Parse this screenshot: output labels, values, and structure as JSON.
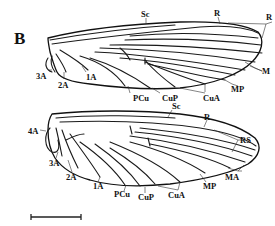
{
  "figure": {
    "panel_letter": "B",
    "colors": {
      "ink": "#111111",
      "background": "#ffffff"
    }
  },
  "forewing": {
    "labels": {
      "sc": "Sc",
      "r": "R",
      "rs_truncated": "R",
      "m": "M",
      "mp": "MP",
      "cua": "CuA",
      "cup": "CuP",
      "pcu": "PCu",
      "a1": "1A",
      "a2": "2A",
      "a3": "3A"
    }
  },
  "hindwing": {
    "labels": {
      "sc": "Sc",
      "r": "R",
      "rs": "RS",
      "ma": "MA",
      "mp": "MP",
      "cua": "CuA",
      "cup": "CuP",
      "pcu": "PCu",
      "a1": "1A",
      "a2": "2A",
      "a3": "3A",
      "a4": "4A"
    }
  },
  "scale_bar": {
    "label": ""
  }
}
